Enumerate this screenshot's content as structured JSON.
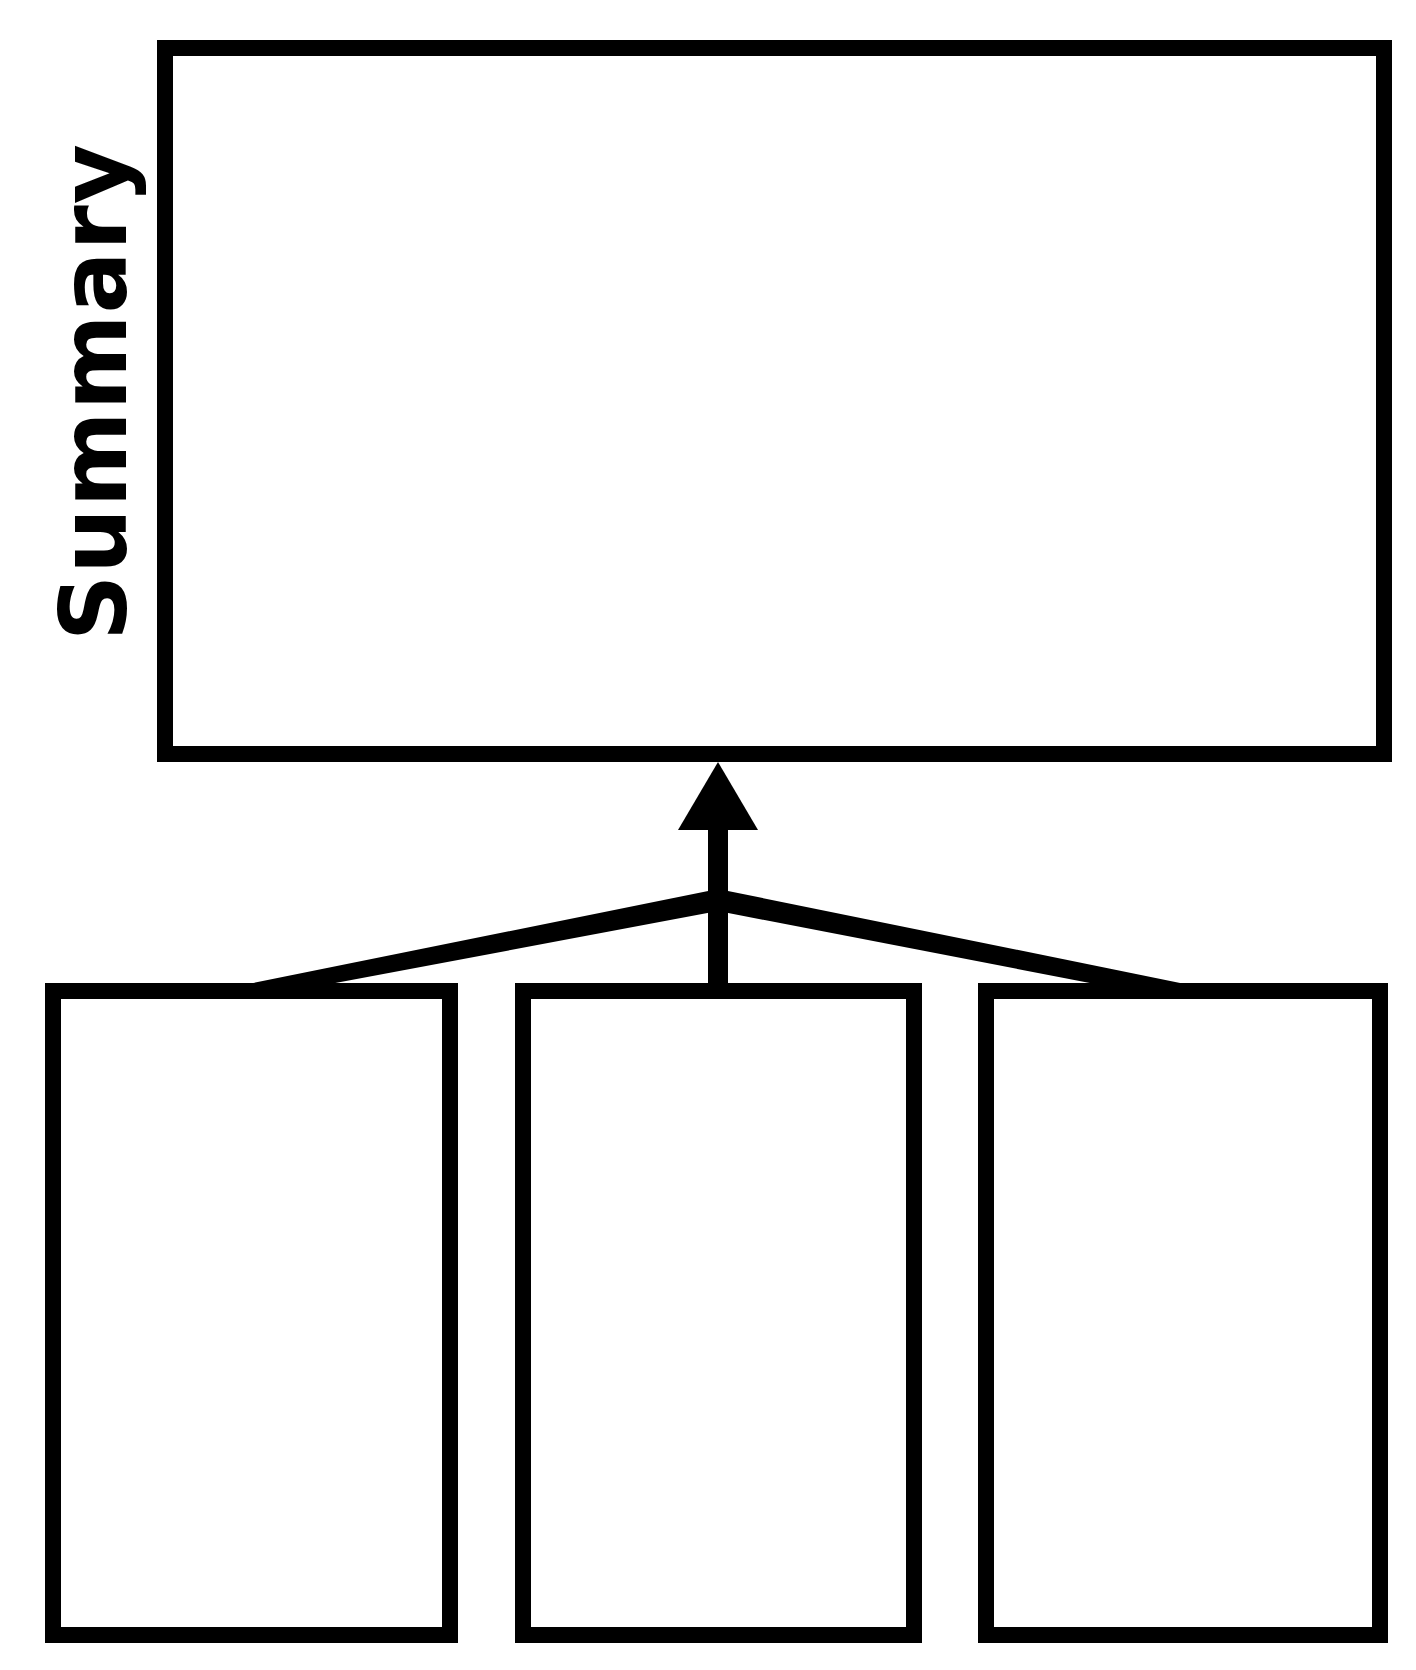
{
  "diagram": {
    "title": "Summary",
    "summary_box": {
      "label": "",
      "content": ""
    },
    "detail_boxes": [
      {
        "label": "",
        "content": ""
      },
      {
        "label": "",
        "content": ""
      },
      {
        "label": "",
        "content": ""
      }
    ],
    "connector": {
      "type": "converging-arrow",
      "from": [
        "detail_boxes.0",
        "detail_boxes.1",
        "detail_boxes.2"
      ],
      "to": "summary_box",
      "arrowhead": "up"
    },
    "colors": {
      "stroke": "#000000",
      "background": "#ffffff"
    }
  }
}
